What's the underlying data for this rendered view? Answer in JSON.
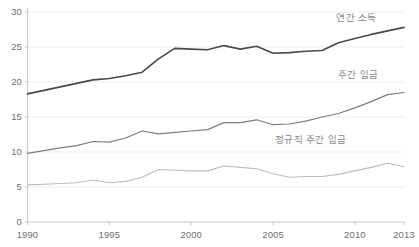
{
  "chart_data": {
    "type": "line",
    "title": "",
    "subtitle": "",
    "xlabel": "",
    "ylabel": "",
    "xlim": [
      1990,
      2013
    ],
    "ylim": [
      0,
      30
    ],
    "grid": true,
    "grid_axis": "y",
    "legend_position": "inline-right",
    "x": [
      1990,
      1991,
      1992,
      1993,
      1994,
      1995,
      1996,
      1997,
      1998,
      1999,
      2000,
      2001,
      2002,
      2003,
      2004,
      2005,
      2006,
      2007,
      2008,
      2009,
      2010,
      2011,
      2012,
      2013
    ],
    "xticks": [
      1990,
      1995,
      2000,
      2005,
      2010,
      2013
    ],
    "xtick_labels": [
      "1990",
      "1995",
      "2000",
      "2005",
      "2010",
      "2013"
    ],
    "yticks": [
      0,
      5,
      10,
      15,
      20,
      25,
      30
    ],
    "ytick_labels": [
      "0",
      "5",
      "10",
      "15",
      "20",
      "25",
      "30"
    ],
    "series": [
      {
        "name": "연간 소득",
        "color": "#4a4a4a",
        "width": 1.6,
        "label_x": 2010.1,
        "label_y": 29.1,
        "values": [
          18.3,
          18.8,
          19.3,
          19.8,
          20.3,
          20.5,
          20.9,
          21.4,
          23.3,
          24.8,
          24.7,
          24.6,
          25.2,
          24.7,
          25.1,
          24.1,
          24.2,
          24.4,
          24.5,
          25.6,
          26.2,
          26.8,
          27.3,
          27.8
        ]
      },
      {
        "name": "주간 임금",
        "color": "#7d7d7d",
        "width": 1.2,
        "label_x": 2010.2,
        "label_y": 21.0,
        "values": [
          9.8,
          10.2,
          10.6,
          10.9,
          11.5,
          11.4,
          12.0,
          13.0,
          12.6,
          12.8,
          13.0,
          13.2,
          14.2,
          14.2,
          14.6,
          13.9,
          14.0,
          14.4,
          15.0,
          15.5,
          16.3,
          17.2,
          18.2,
          18.5
        ]
      },
      {
        "name": "정규직 주간 임금",
        "color": "#bdbdbd",
        "width": 1.1,
        "label_x": 2007.3,
        "label_y": 11.7,
        "values": [
          5.3,
          5.4,
          5.5,
          5.6,
          6.0,
          5.6,
          5.8,
          6.4,
          7.5,
          7.4,
          7.3,
          7.3,
          8.0,
          7.8,
          7.6,
          6.9,
          6.4,
          6.5,
          6.5,
          6.8,
          7.3,
          7.8,
          8.4,
          7.9
        ]
      }
    ],
    "axis_color": "#c9c9c9",
    "grid_color": "#ededed",
    "tick_text_color": "#6f6f6f",
    "label_text_color": "#8a8a8a",
    "background": "#ffffff"
  }
}
